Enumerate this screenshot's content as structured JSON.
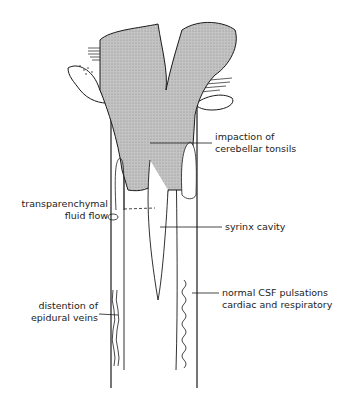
{
  "diagram": {
    "labels": {
      "impaction": [
        "impaction of",
        "cerebellar tonsils"
      ],
      "transparenchymal": [
        "transparenchymal",
        "fluid flow"
      ],
      "syrinx": [
        "syrinx cavity"
      ],
      "epidural": [
        "distention of",
        "epidural veins"
      ],
      "csf": [
        "normal CSF pulsations",
        "cardiac and respiratory"
      ]
    },
    "colors": {
      "line": "#1a1a1a",
      "shading": "#bdbdbd",
      "background": "#ffffff"
    }
  }
}
